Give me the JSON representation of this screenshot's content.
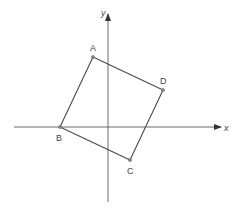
{
  "figure": {
    "type": "coordinate-plane-diagram",
    "axes": {
      "x_label": "x",
      "y_label": "y"
    },
    "polygon": {
      "name": "quadrilateral ABCD",
      "vertex_order": [
        "A",
        "D",
        "C",
        "B"
      ]
    },
    "points": [
      {
        "label": "A"
      },
      {
        "label": "B"
      },
      {
        "label": "C"
      },
      {
        "label": "D"
      }
    ],
    "colors": {
      "axis": "#6b6b6b",
      "shape": "#4a4a4a",
      "text": "#444444"
    }
  }
}
